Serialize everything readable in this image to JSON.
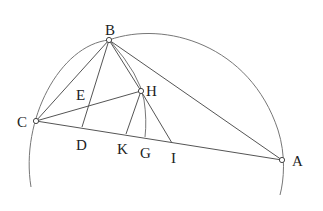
{
  "diagram": {
    "type": "geometric-construction",
    "points": {
      "A": {
        "label": "A",
        "x": 282,
        "y": 160
      },
      "B": {
        "label": "B",
        "x": 109,
        "y": 40
      },
      "C": {
        "label": "C",
        "x": 36,
        "y": 121
      },
      "D": {
        "label": "D",
        "x": 82,
        "y": 127
      },
      "E": {
        "label": "E",
        "x": 89,
        "y": 105
      },
      "H": {
        "label": "H",
        "x": 141,
        "y": 91
      },
      "K": {
        "label": "K",
        "x": 126,
        "y": 134
      },
      "G": {
        "label": "G",
        "x": 145,
        "y": 137
      },
      "I": {
        "label": "I",
        "x": 172,
        "y": 143
      }
    },
    "segments": [
      "BC",
      "BA",
      "CA",
      "BD",
      "BH",
      "CH",
      "HK",
      "HI",
      "BI"
    ],
    "arcs": [
      "big circle through C, B, A",
      "arc B–H–G"
    ],
    "labels": {
      "A": "A",
      "B": "B",
      "C": "C",
      "D": "D",
      "E": "E",
      "H": "H",
      "K": "K",
      "G": "G",
      "I": "I"
    }
  }
}
